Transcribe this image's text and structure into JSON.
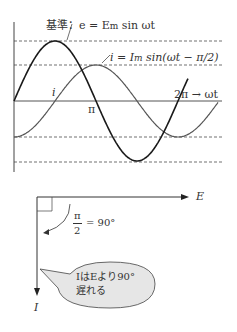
{
  "waveform": {
    "reference_label": "基準：e = E",
    "reference_sub": "m",
    "reference_tail": " sin ωt",
    "current_label": "i = I",
    "current_sub": "m",
    "current_tail": " sin(ωt − π/2)",
    "i_marker": "i",
    "pi_marker": "π",
    "two_pi_marker": "2π  →  ωt",
    "colors": {
      "e_curve": "#1a1a1a",
      "i_curve": "#555555",
      "axis": "#444444",
      "dashed": "#333333"
    }
  },
  "phasor": {
    "e_label": "E",
    "i_label": "I",
    "angle_num": "π",
    "angle_den": "2",
    "angle_eq": "= 90°",
    "bubble_line1": "IはEより90°",
    "bubble_line2": "遅れる",
    "bubble_fill": "#e6e6e6"
  }
}
